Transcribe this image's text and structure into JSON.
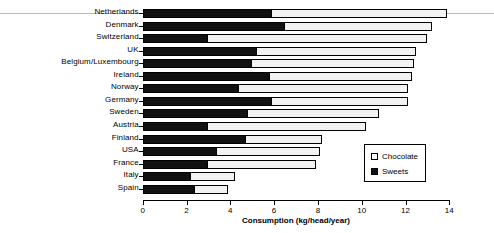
{
  "chart_data": {
    "type": "bar",
    "orientation": "horizontal",
    "stacked": true,
    "title": "",
    "subtitle": "",
    "xlabel": "Consumption (kg/head/year)",
    "ylabel": "",
    "xlim": [
      0,
      14
    ],
    "xticks": [
      0,
      2,
      4,
      6,
      8,
      10,
      12,
      14
    ],
    "xtick_labels": [
      "0",
      "2",
      "4",
      "6",
      "8",
      "10",
      "12",
      "14"
    ],
    "grid": false,
    "legend_position": "middle-right",
    "categories": [
      "Netherlands",
      "Denmark",
      "Switzerland",
      "UK",
      "Belgium/Luxembourg",
      "Ireland",
      "Norway",
      "Germany",
      "Sweden",
      "Austria",
      "Finland",
      "USA",
      "France",
      "Italy",
      "Spain"
    ],
    "series": [
      {
        "name": "Sweets",
        "color": "#111111",
        "values": [
          5.9,
          6.5,
          3.0,
          5.2,
          5.0,
          5.8,
          4.4,
          5.9,
          4.8,
          3.0,
          4.7,
          3.4,
          3.0,
          2.2,
          2.4
        ]
      },
      {
        "name": "Chocolate",
        "color": "#f2f2f2",
        "values": [
          8.0,
          6.7,
          10.0,
          7.3,
          7.4,
          6.5,
          7.7,
          6.2,
          6.0,
          7.2,
          3.5,
          4.7,
          4.9,
          2.0,
          1.5
        ]
      }
    ],
    "totals": [
      13.9,
      13.2,
      13.0,
      12.5,
      12.4,
      12.3,
      12.1,
      12.1,
      10.8,
      10.2,
      8.2,
      8.1,
      7.9,
      4.2,
      3.9
    ]
  },
  "legend": {
    "entries": [
      {
        "label": "Chocolate",
        "swatch": "open-square-icon"
      },
      {
        "label": "Sweets",
        "swatch": "filled-square-icon"
      }
    ]
  }
}
